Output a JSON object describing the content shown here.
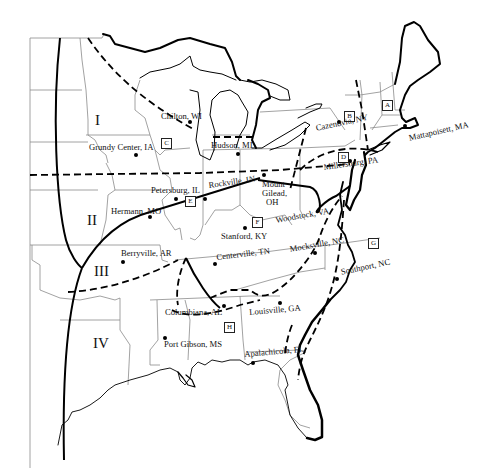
{
  "map": {
    "title": "",
    "zones": [
      {
        "id": "I",
        "label": "I"
      },
      {
        "id": "II",
        "label": "II"
      },
      {
        "id": "III",
        "label": "III"
      },
      {
        "id": "IV",
        "label": "IV"
      }
    ],
    "subregions": [
      {
        "id": "A",
        "label": "A"
      },
      {
        "id": "B",
        "label": "B"
      },
      {
        "id": "C",
        "label": "C"
      },
      {
        "id": "D",
        "label": "D"
      },
      {
        "id": "E",
        "label": "E"
      },
      {
        "id": "F",
        "label": "F"
      },
      {
        "id": "G",
        "label": "G"
      },
      {
        "id": "H",
        "label": "H"
      }
    ],
    "locations": [
      {
        "name": "Chilton, WI"
      },
      {
        "name": "Grundy Center, IA"
      },
      {
        "name": "Hudson, MI"
      },
      {
        "name": "Cazenovia, NY"
      },
      {
        "name": "Mattapoisett, MA"
      },
      {
        "name": "Millersburg, PA"
      },
      {
        "name": "Petersburg, IL"
      },
      {
        "name": "Rockville, IN"
      },
      {
        "name": "Mount"
      },
      {
        "name": "Gilead,"
      },
      {
        "name": "OH"
      },
      {
        "name": "Hermann, MO"
      },
      {
        "name": "Woodstock, VA"
      },
      {
        "name": "Stanford, KY"
      },
      {
        "name": "Berryville, AR"
      },
      {
        "name": "Centerville, TN"
      },
      {
        "name": "Mocksville, NC"
      },
      {
        "name": "Southport, NC"
      },
      {
        "name": "Columbiana, AL"
      },
      {
        "name": "Louisville, GA"
      },
      {
        "name": "Port Gibson, MS"
      },
      {
        "name": "Apalachicola, FL"
      }
    ],
    "legend_colors": {
      "ink": "#000000",
      "state_lines": "#8a8a8a",
      "background": "#ffffff"
    }
  }
}
